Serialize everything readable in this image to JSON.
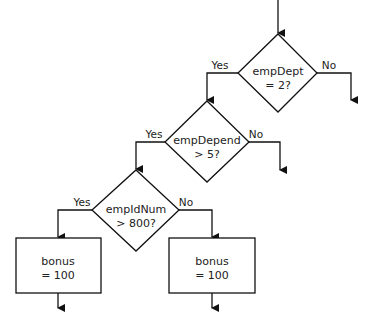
{
  "diagram": {
    "type": "flowchart",
    "decisions": [
      {
        "id": "d1",
        "line1": "empDept",
        "line2": "= 2?",
        "yes_label": "Yes",
        "no_label": "No"
      },
      {
        "id": "d2",
        "line1": "empDepend",
        "line2": "> 5?",
        "yes_label": "Yes",
        "no_label": "No"
      },
      {
        "id": "d3",
        "line1": "empIdNum",
        "line2": "> 800?",
        "yes_label": "Yes",
        "no_label": "No"
      }
    ],
    "processes": [
      {
        "id": "p1",
        "line1": "bonus",
        "line2": "= 100"
      },
      {
        "id": "p2",
        "line1": "bonus",
        "line2": "= 100"
      }
    ]
  }
}
